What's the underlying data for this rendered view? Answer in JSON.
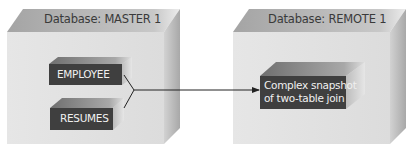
{
  "diagram": {
    "left_database": {
      "label": "Database: MASTER 1",
      "tables": [
        {
          "label": "EMPLOYEE"
        },
        {
          "label": "RESUMES"
        }
      ]
    },
    "right_database": {
      "label": "Database: REMOTE 1",
      "snapshot": {
        "line1": "Complex snapshot",
        "line2": "of two-table join"
      }
    },
    "connector": "arrow-from-tables-to-snapshot",
    "colors": {
      "cube_front": "#e2e2e2",
      "cube_top": "#a9a9a9",
      "cube_side": "#c4c4c4",
      "box_front": "#3f3f3f",
      "box_top": "#8a8a8a",
      "box_side": "#a0a0a0",
      "line": "#222222"
    }
  }
}
